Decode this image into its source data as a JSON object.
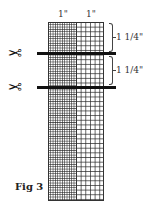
{
  "figure": {
    "caption": "Fig 3",
    "column_labels": [
      "1\"",
      "1\""
    ],
    "dimension_labels": [
      "1 1/4\"",
      "1 1/4\""
    ],
    "icons": {
      "scissors": "✂"
    },
    "colors": {
      "grid_line": "#333333",
      "cut_bar": "#111111",
      "background": "#ffffff"
    }
  }
}
